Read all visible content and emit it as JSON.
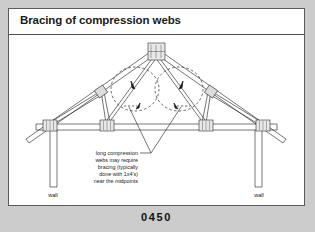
{
  "panel": {
    "title": "Bracing of compression webs",
    "page_number": "0450",
    "border_color": "#5a5a5a",
    "background_color": "#ffffff",
    "outer_background_color": "#cccccc"
  },
  "diagram": {
    "type": "truss-elevation",
    "line_color": "#2b2b2b",
    "annotation": {
      "lines": [
        "long compression",
        "webs may require",
        "bracing (typically",
        "done with 1x4's)",
        "near the midpoints"
      ]
    },
    "labels": {
      "wall_left": "wall",
      "wall_right": "wall"
    },
    "highlight_circles": 2,
    "gusset_plates": 7,
    "geometry": {
      "peak": [
        147,
        14
      ],
      "left_heel": [
        38,
        92
      ],
      "right_heel": [
        256,
        92
      ],
      "bottom_chord_y": 92,
      "overhang_left": [
        18,
        106
      ],
      "overhang_right": [
        276,
        106
      ],
      "bottom_joints": [
        [
          38,
          92
        ],
        [
          95,
          92
        ],
        [
          199,
          92
        ],
        [
          256,
          92
        ]
      ],
      "rafter_mid_left": [
        92,
        57
      ],
      "rafter_mid_right": [
        202,
        57
      ]
    }
  }
}
